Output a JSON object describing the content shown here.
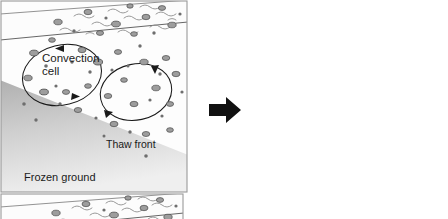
{
  "figure": {
    "panel_count": 2,
    "background_color": "#ffffff"
  },
  "transition": {
    "icon": "right-arrow-icon",
    "color": "#111111",
    "meaning": "time progression from initial state to evolved state"
  },
  "palette": {
    "frame_stroke": "#9a9a9a",
    "active_layer_fill": "#fdfdfd",
    "organic_mat_fill": "#fbfbfb",
    "frozen_ground_top": "#b4b4b4",
    "frozen_ground_bottom": "#ededed",
    "clast_fill": "#9d9d9d",
    "clast_stroke": "#4a4a4a",
    "clast_dark": "#6e6e6e",
    "flow_line": "#1a1a1a",
    "squiggle": "#8c8c8c",
    "surface_line": "#555555"
  },
  "panels": [
    {
      "id": "before",
      "name": "initial-state",
      "labels": [
        {
          "id": "convection-cell",
          "line1": "Convection",
          "line2": "cell",
          "x": 42,
          "y": 62
        },
        {
          "id": "thaw-front",
          "text": "Thaw front",
          "x": 106,
          "y": 148
        },
        {
          "id": "frozen-ground",
          "text": "Frozen ground",
          "x": 24,
          "y": 181
        }
      ],
      "thaw_front_shape": "straight diagonal",
      "convection_cells": [
        {
          "id": "cell-left",
          "cx": 62,
          "cy": 75,
          "rx": 40,
          "ry": 30,
          "rotation": -14,
          "direction": "counter-clockwise"
        },
        {
          "id": "cell-right",
          "cx": 136,
          "cy": 92,
          "rx": 36,
          "ry": 28,
          "rotation": -12,
          "direction": "counter-clockwise"
        }
      ]
    },
    {
      "id": "after",
      "name": "evolved-state",
      "labels": [],
      "thaw_front_shape": "scalloped beneath convection cells",
      "convection_cells": [
        {
          "id": "cell-left",
          "cx": 62,
          "cy": 78,
          "rx": 42,
          "ry": 32,
          "rotation": -10,
          "direction": "counter-clockwise"
        },
        {
          "id": "cell-right",
          "cx": 142,
          "cy": 96,
          "rx": 38,
          "ry": 30,
          "rotation": -10,
          "direction": "counter-clockwise"
        }
      ]
    }
  ]
}
